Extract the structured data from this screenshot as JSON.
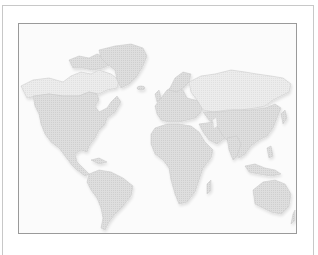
{
  "map": {
    "type": "world-map",
    "style": "dotted-gray",
    "colors": {
      "background": "#fbfbfb",
      "land": "#d9d9d9",
      "land_north": "#e9e9e9",
      "coast": "#c4c4c4",
      "outer_border": "#c8c8c8",
      "inner_border": "#9a9a9a"
    },
    "regions": [
      "North America",
      "Greenland",
      "South America",
      "Europe",
      "Africa",
      "Asia",
      "Australia"
    ]
  }
}
